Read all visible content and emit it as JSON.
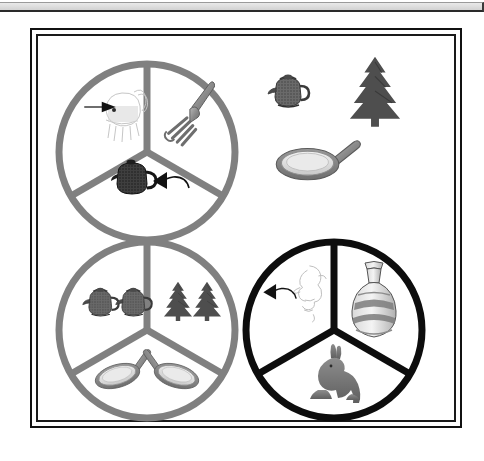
{
  "page": {
    "background_color": "#ffffff",
    "top_rule": {
      "name": "page-top-rule",
      "fill": "#d2d2d2",
      "stroke": "#2a2a2a"
    }
  },
  "figure": {
    "frame": {
      "outer_stroke_color": "#111111",
      "inner_stroke_color": "#1a1a1a",
      "background_color": "#ffffff"
    },
    "colors": {
      "gray_stroke": "#808080",
      "black_stroke": "#0d0d0d",
      "object_dark_gray": "#4a4a4a",
      "object_mid_gray": "#6e6e6e",
      "object_light_gray": "#cfcfcf",
      "faint_sketch": "#b8b8b8"
    },
    "circles": [
      {
        "id": "circle-top-left",
        "label": "top-left-circle",
        "stroke_color": "#808080",
        "stroke_style": "thick-gray",
        "cx": 115,
        "cy": 122,
        "r": 88,
        "sectors": [
          {
            "id": "sector-upper-left",
            "position": "upper-left",
            "contents": [
              "faint-animal-sketch",
              "pointing-arrow"
            ],
            "count": 1
          },
          {
            "id": "sector-upper-right",
            "position": "upper-right",
            "contents": [
              "fork"
            ],
            "count": 1
          },
          {
            "id": "sector-bottom",
            "position": "bottom",
            "contents": [
              "dark-teapot",
              "pointing-arrow"
            ],
            "count": 1
          }
        ]
      },
      {
        "id": "circle-bottom-left",
        "label": "bottom-left-circle",
        "stroke_color": "#808080",
        "stroke_style": "thick-gray",
        "cx": 115,
        "cy": 300,
        "r": 88,
        "sectors": [
          {
            "id": "sector-upper-left",
            "position": "upper-left",
            "contents": [
              "teapot",
              "teapot"
            ],
            "count": 2
          },
          {
            "id": "sector-upper-right",
            "position": "upper-right",
            "contents": [
              "pine-tree",
              "pine-tree"
            ],
            "count": 2
          },
          {
            "id": "sector-bottom",
            "position": "bottom",
            "contents": [
              "frying-pan",
              "frying-pan"
            ],
            "count": 2
          }
        ]
      },
      {
        "id": "circle-bottom-right",
        "label": "bottom-right-circle",
        "stroke_color": "#0d0d0d",
        "stroke_style": "thick-black",
        "cx": 302,
        "cy": 300,
        "r": 88,
        "sectors": [
          {
            "id": "sector-upper-left",
            "position": "upper-left",
            "contents": [
              "faint-face-profile-sketch",
              "pointing-arrow"
            ],
            "count": 1
          },
          {
            "id": "sector-upper-right",
            "position": "upper-right",
            "contents": [
              "decorated-vase"
            ],
            "count": 1
          },
          {
            "id": "sector-bottom",
            "position": "bottom",
            "contents": [
              "rabbit"
            ],
            "count": 1
          }
        ]
      }
    ],
    "loose_objects": [
      {
        "id": "loose-teapot",
        "name": "teapot-icon",
        "x": 264,
        "y": 67,
        "width": 44,
        "height": 42
      },
      {
        "id": "loose-pine-tree",
        "name": "pine-tree-icon",
        "x": 340,
        "y": 52,
        "width": 62,
        "height": 68
      },
      {
        "id": "loose-frying-pan",
        "name": "frying-pan-icon",
        "x": 272,
        "y": 130,
        "width": 80,
        "height": 48
      }
    ]
  }
}
